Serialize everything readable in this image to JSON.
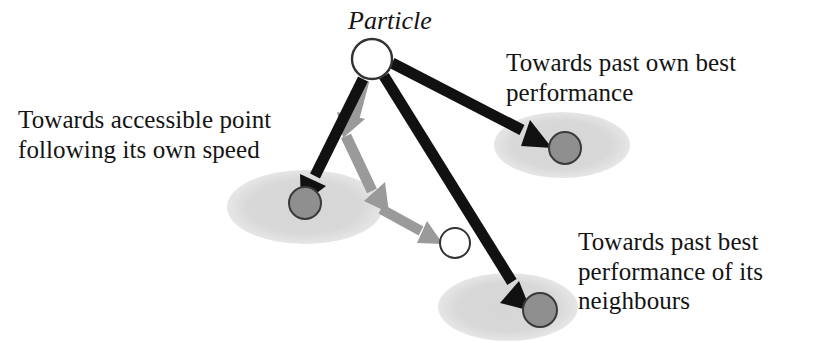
{
  "figure": {
    "title_label": "Particle",
    "background_color": "#ffffff",
    "text_color": "#141414",
    "arrow_black_color": "#111111",
    "arrow_gray_color": "#9a9a9a",
    "ellipse_color": "#d9d9d9",
    "marker_fill_color": "#8f8f8f",
    "marker_stroke_color": "#3a3a3a",
    "particle_fill_color": "#ffffff",
    "particle_stroke_color": "#333333"
  },
  "captions": {
    "accessible_point": "Towards accessible point\nfollowing its own speed",
    "own_best": "Towards past own best\nperformance",
    "neighbours_best": "Towards past best\nperformance of its\nneighbours"
  },
  "nodes": {
    "particle": {
      "name": "particle",
      "cx": 372,
      "cy": 59,
      "r": 20
    },
    "accessible_point": {
      "name": "accessible-point",
      "cx": 455,
      "cy": 243,
      "r": 15
    },
    "own_best_marker": {
      "name": "own-best-marker",
      "cx": 565,
      "cy": 148,
      "r": 16
    },
    "neighbour_best_marker": {
      "name": "neighbour-best-marker",
      "cx": 540,
      "cy": 310,
      "r": 17
    },
    "speed_target_marker": {
      "name": "speed-target-marker",
      "cx": 305,
      "cy": 203,
      "r": 16
    }
  },
  "regions": {
    "left_region": {
      "cx": 305,
      "cy": 207,
      "rx": 78,
      "ry": 37
    },
    "upper_right_region": {
      "cx": 562,
      "cy": 145,
      "rx": 68,
      "ry": 33
    },
    "lower_right_region": {
      "cx": 508,
      "cy": 307,
      "rx": 70,
      "ry": 34
    }
  },
  "arrows": {
    "to_speed_target": {
      "label": "towards-accessible-point-arrow",
      "color": "black"
    },
    "to_own_best": {
      "label": "towards-own-best-arrow",
      "color": "black"
    },
    "to_neighbour_best": {
      "label": "towards-neighbour-best-arrow",
      "color": "black"
    },
    "velocity_step_1": {
      "label": "velocity-vector-segment-1",
      "color": "gray"
    },
    "velocity_step_2": {
      "label": "velocity-vector-segment-2",
      "color": "gray"
    },
    "velocity_step_3": {
      "label": "velocity-vector-segment-3",
      "color": "gray"
    }
  }
}
